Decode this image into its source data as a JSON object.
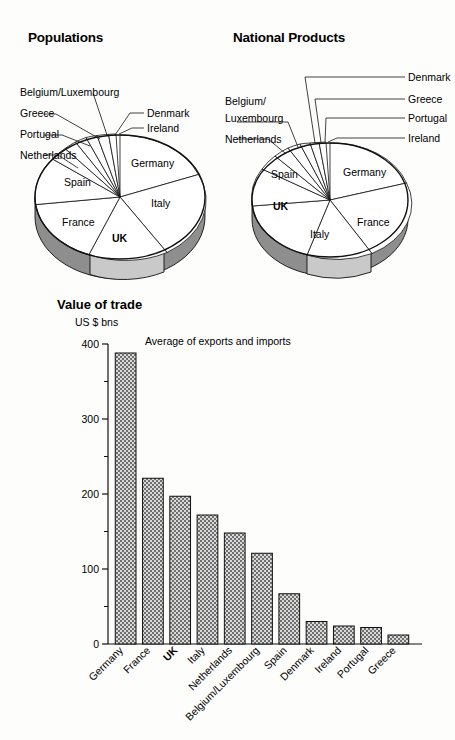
{
  "page": {
    "background": "#fdfdfc",
    "ink": "#111111"
  },
  "populations": {
    "title": "Populations",
    "labels": {
      "belgium_luxembourg": "Belgium/Luxembourg",
      "greece": "Greece",
      "portugal": "Portugal",
      "netherlands": "Netherlands",
      "denmark": "Denmark",
      "ireland": "Ireland",
      "germany": "Germany",
      "italy": "Italy",
      "uk": "UK",
      "france": "France",
      "spain": "Spain"
    }
  },
  "national_products": {
    "title": "National Products",
    "labels": {
      "belgium_line1": "Belgium/",
      "belgium_line2": "Luxembourg",
      "netherlands": "Netherlands",
      "denmark": "Denmark",
      "greece": "Greece",
      "portugal": "Portugal",
      "ireland": "Ireland",
      "germany": "Germany",
      "france": "France",
      "italy": "Italy",
      "uk": "UK",
      "spain": "Spain"
    }
  },
  "value_of_trade": {
    "title": "Value of trade",
    "units": "US $ bns",
    "note": "Average of exports and imports"
  },
  "chart_data": [
    {
      "type": "pie",
      "title": "Populations",
      "legend_position": "callout-labels",
      "unit": "share of EC total",
      "labels": [
        "Germany",
        "Italy",
        "UK",
        "France",
        "Spain",
        "Netherlands",
        "Portugal",
        "Greece",
        "Belgium/Luxembourg",
        "Denmark",
        "Ireland"
      ],
      "values": [
        24.0,
        17.5,
        17.3,
        17.2,
        12.0,
        4.6,
        3.0,
        3.0,
        3.1,
        1.6,
        1.1
      ]
    },
    {
      "type": "pie",
      "title": "National Products",
      "legend_position": "callout-labels",
      "unit": "share of EC total",
      "labels": [
        "Germany",
        "France",
        "Italy",
        "UK",
        "Spain",
        "Netherlands",
        "Belgium/Luxembourg",
        "Denmark",
        "Greece",
        "Portugal",
        "Ireland"
      ],
      "values": [
        26.5,
        20.5,
        17.5,
        16.5,
        8.0,
        4.6,
        3.4,
        1.9,
        1.0,
        0.8,
        0.6
      ]
    },
    {
      "type": "bar",
      "title": "Value of trade",
      "subtitle": "Average of exports and imports",
      "ylabel": "US $ bns",
      "xlabel": "",
      "ylim": [
        0,
        400
      ],
      "yticks": [
        0,
        100,
        200,
        300,
        400
      ],
      "yminorticks": [
        50,
        150,
        250,
        350
      ],
      "grid": false,
      "categories": [
        "Germany",
        "France",
        "UK",
        "Italy",
        "Netherlands",
        "Belgium/Luxembourg",
        "Spain",
        "Denmark",
        "Ireland",
        "Portugal",
        "Greece"
      ],
      "values": [
        388,
        221,
        197,
        172,
        148,
        121,
        67,
        30,
        24,
        22,
        12
      ],
      "highlight_category": "UK"
    }
  ]
}
